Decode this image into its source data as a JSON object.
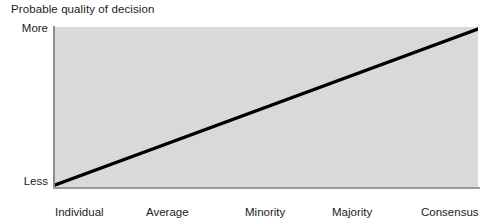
{
  "chart_data": {
    "type": "line",
    "title": "Probable quality of decision",
    "xlabel": "",
    "ylabel": "Probable quality of decision",
    "grid": false,
    "legend": null,
    "categories": [
      "Individual",
      "Average individual",
      "Minority control",
      "Majority control",
      "Consensus"
    ],
    "x": [
      0,
      1,
      2,
      3,
      4
    ],
    "y_tick_labels": [
      "More",
      "Less"
    ],
    "ylim": [
      0,
      1
    ],
    "series": [
      {
        "name": "Probable quality of decision",
        "values": [
          0,
          0.25,
          0.5,
          0.75,
          1
        ],
        "color": "#000000"
      }
    ],
    "annotations": [],
    "plot_background": "#d9d9d9",
    "line_color": "#000000",
    "axis_color": "#949494"
  },
  "chart": {
    "title": "Probable quality of decision",
    "y_axis": {
      "high_label": "More",
      "low_label": "Less"
    },
    "x_axis": {
      "ticks": [
        {
          "line1": "Individual",
          "line2": ""
        },
        {
          "line1": "Average",
          "line2": "individual"
        },
        {
          "line1": "Minority",
          "line2": "control"
        },
        {
          "line1": "Majority",
          "line2": "control"
        },
        {
          "line1": "Consensus",
          "line2": ""
        }
      ]
    }
  }
}
